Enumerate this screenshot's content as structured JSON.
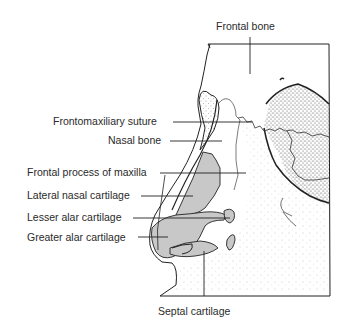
{
  "labels": {
    "frontal_bone": "Frontal bone",
    "frontomaxillary_suture": "Frontomaxiliary suture",
    "nasal_bone": "Nasal bone",
    "frontal_process_of_maxilla": "Frontal process of maxilla",
    "lateral_nasal_cartilage": "Lateral nasal cartilage",
    "lesser_alar_cartilage": "Lesser alar cartilage",
    "greater_alar_cartilage": "Greater alar cartilage",
    "septal_cartilage": "Septal cartilage"
  },
  "colors": {
    "ink": "#1e1e1e",
    "cartilage_fill": "#c8c8c8",
    "stipple": "#555555",
    "background": "#ffffff"
  }
}
